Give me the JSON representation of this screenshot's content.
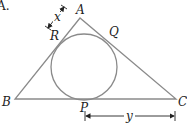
{
  "figure": {
    "question_label": "A.",
    "vertices": {
      "A": "A",
      "B": "B",
      "C": "C"
    },
    "tangent_points": {
      "P": "P",
      "Q": "Q",
      "R": "R"
    },
    "dimensions": {
      "AR": "x",
      "PC": "y"
    },
    "colors": {
      "line": "#8a8a8a",
      "text": "#222222",
      "arrow": "#222222"
    }
  }
}
